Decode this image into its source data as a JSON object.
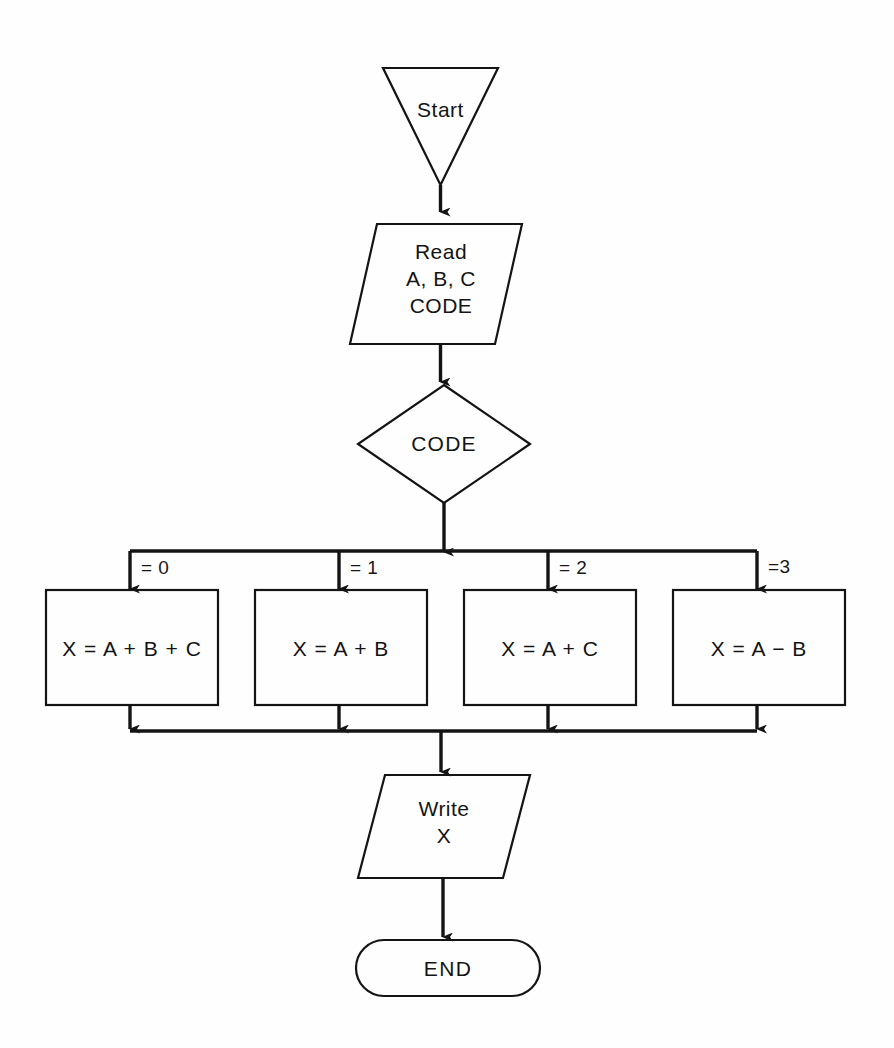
{
  "diagram": {
    "background_color": "#fefefe",
    "line_color": "#141414",
    "text_color": "#141414"
  },
  "nodes": {
    "start": {
      "label": "Start",
      "shape": "inverted-triangle"
    },
    "read": {
      "label": "Read\nA, B, C\nCODE",
      "shape": "parallelogram"
    },
    "decision": {
      "label": "CODE",
      "shape": "diamond"
    },
    "write": {
      "label": "Write\nX",
      "shape": "parallelogram"
    },
    "end": {
      "label": "END",
      "shape": "stadium"
    }
  },
  "branches": [
    {
      "label": "= 0",
      "process": "X = A + B + C"
    },
    {
      "label": "= 1",
      "process": "X = A + B"
    },
    {
      "label": "= 2",
      "process": "X = A + C"
    },
    {
      "label": "=3",
      "process": "X = A − B"
    }
  ]
}
